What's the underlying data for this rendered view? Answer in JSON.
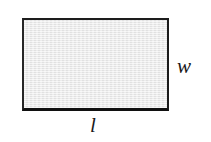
{
  "figure": {
    "type": "geometry-diagram",
    "shape": "rectangle",
    "background_color": "#ffffff",
    "rectangle": {
      "fill_color": "#e8e8e8",
      "border_color": "#1a1a1a",
      "border_width_px": 2
    },
    "labels": {
      "width": "w",
      "length": "l"
    }
  }
}
